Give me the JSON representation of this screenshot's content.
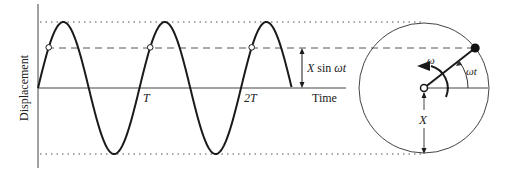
{
  "diagram": {
    "y_axis_label": "Displacement",
    "x_axis_label": "Time",
    "tick_labels": [
      "T",
      "2T"
    ],
    "projection_label_x": "X",
    "projection_label_rest": " sin ",
    "projection_label_omega_t": "ωt",
    "phasor": {
      "omega_label": "ω",
      "angle_label": "ωt",
      "radius_label": "X",
      "angle_deg": 38
    },
    "wave": {
      "cycles": 2.5,
      "amplitude_units": 1,
      "sample_phase_fraction": 0.62
    },
    "colors": {
      "stroke": "#1a1a1a",
      "guide": "#555555",
      "circle": "#444444"
    }
  }
}
